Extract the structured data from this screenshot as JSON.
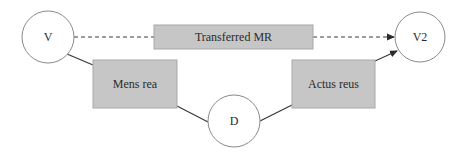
{
  "diagram": {
    "nodes": {
      "v": {
        "label": "V",
        "shape": "circle",
        "cx": 48,
        "cy": 37,
        "r": 26
      },
      "v2": {
        "label": "V2",
        "shape": "circle",
        "cx": 420,
        "cy": 37,
        "r": 25
      },
      "d": {
        "label": "D",
        "shape": "circle",
        "cx": 234,
        "cy": 121,
        "r": 26
      },
      "transferred_mr": {
        "label": "Transferred MR",
        "shape": "box",
        "x": 154,
        "y": 25,
        "w": 159,
        "h": 24
      },
      "mens_rea": {
        "label": "Mens rea",
        "shape": "box",
        "x": 93,
        "y": 60,
        "w": 84,
        "h": 48
      },
      "actus_reus": {
        "label": "Actus reus",
        "shape": "box",
        "x": 292,
        "y": 60,
        "w": 83,
        "h": 48
      }
    },
    "edges": [
      {
        "from": "V",
        "to": "Transferred MR",
        "style": "dashed",
        "arrow": false
      },
      {
        "from": "Transferred MR",
        "to": "V2",
        "style": "dashed",
        "arrow": true
      },
      {
        "from": "V",
        "to": "Mens rea",
        "style": "solid",
        "arrow": false
      },
      {
        "from": "Mens rea",
        "to": "D",
        "style": "solid",
        "arrow": false
      },
      {
        "from": "D",
        "to": "Actus reus",
        "style": "solid",
        "arrow": false
      },
      {
        "from": "Actus reus",
        "to": "V2",
        "style": "solid",
        "arrow": true
      }
    ],
    "colors": {
      "box_fill": "#c6c6c6",
      "circle_fill": "#ffffff",
      "line": "#3a3a3a",
      "text": "#2b2b2b"
    }
  }
}
